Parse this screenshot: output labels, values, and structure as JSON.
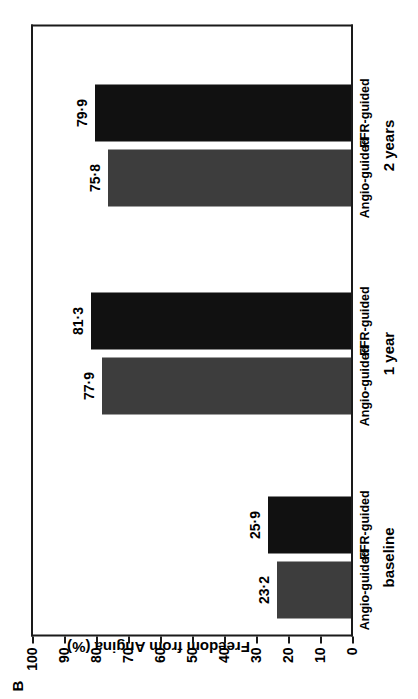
{
  "panel": {
    "letter": "B"
  },
  "axes": {
    "y_title": "Freedom from Angina (%)",
    "y_ticks": [
      "100",
      "90",
      "80",
      "70",
      "60",
      "50",
      "40",
      "30",
      "20",
      "10",
      "0"
    ]
  },
  "groups": [
    {
      "label": "baseline"
    },
    {
      "label": "1 year"
    },
    {
      "label": "2 years"
    }
  ],
  "series": [
    {
      "name": "Angio-guided",
      "color": "#3d3d3d"
    },
    {
      "name": "FFR-guided",
      "color": "#111111"
    }
  ],
  "bars": [
    {
      "group": "baseline",
      "series": "Angio-guided",
      "label": "Angio-guided",
      "value_text": "23·2",
      "value": 23.2
    },
    {
      "group": "baseline",
      "series": "FFR-guided",
      "label": "FFR-guided",
      "value_text": "25·9",
      "value": 25.9
    },
    {
      "group": "1 year",
      "series": "Angio-guided",
      "label": "Angio-guided",
      "value_text": "77·9",
      "value": 77.9
    },
    {
      "group": "1 year",
      "series": "FFR-guided",
      "label": "FFR-guided",
      "value_text": "81·3",
      "value": 81.3
    },
    {
      "group": "2 years",
      "series": "Angio-guided",
      "label": "Angio-guided",
      "value_text": "75·8",
      "value": 75.8
    },
    {
      "group": "2 years",
      "series": "FFR-guided",
      "label": "FFR-guided",
      "value_text": "79·9",
      "value": 79.9
    }
  ],
  "chart_data": {
    "type": "bar",
    "title": "B",
    "xlabel": "",
    "ylabel": "Freedom from Angina (%)",
    "ylim": [
      0,
      100
    ],
    "ytick_labels": [
      "0",
      "10",
      "20",
      "30",
      "40",
      "50",
      "60",
      "70",
      "80",
      "90",
      "100"
    ],
    "grid": false,
    "legend": "none",
    "orientation": "vertical-bars-in-rotated-figure",
    "categories": [
      "baseline",
      "1 year",
      "2 years"
    ],
    "series": [
      {
        "name": "Angio-guided",
        "color": "#3d3d3d",
        "values": [
          23.2,
          77.9,
          75.8
        ],
        "value_labels": [
          "23·2",
          "77·9",
          "75·8"
        ]
      },
      {
        "name": "FFR-guided",
        "color": "#111111",
        "values": [
          25.9,
          81.3,
          79.9
        ],
        "value_labels": [
          "25·9",
          "81·3",
          "79·9"
        ]
      }
    ]
  }
}
